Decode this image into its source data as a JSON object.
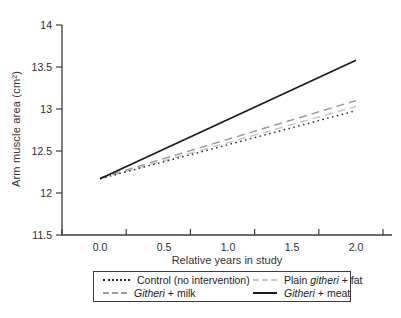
{
  "chart_data": {
    "type": "line",
    "title": "",
    "xlabel": "Relative years in study",
    "ylabel": "Arm muscle area (cm²)",
    "xlim": [
      0,
      2
    ],
    "ylim": [
      11.5,
      14
    ],
    "x_ticks": [
      "0.0",
      "0.5",
      "1.0",
      "1.5",
      "2.0"
    ],
    "y_ticks": [
      "11.5",
      "12",
      "12.5",
      "13",
      "13.5",
      "14"
    ],
    "y_tick_values": [
      11.5,
      12,
      12.5,
      13,
      13.5,
      14
    ],
    "x": [
      0,
      2
    ],
    "series": [
      {
        "name": "Control (no intervention)",
        "values": [
          12.17,
          12.98
        ],
        "style": "dotted",
        "color": "#2b2b2b"
      },
      {
        "name": "Plain githeri + fat",
        "values": [
          12.17,
          13.03
        ],
        "style": "dashed",
        "color": "#c6c6c6"
      },
      {
        "name": "Githeri + milk",
        "values": [
          12.18,
          13.1
        ],
        "style": "dashed",
        "color": "#9a9a9a"
      },
      {
        "name": "Githeri + meat",
        "values": [
          12.17,
          13.58
        ],
        "style": "solid",
        "color": "#1a1a1a"
      }
    ],
    "grid": false,
    "legend_position": "bottom"
  },
  "legend": {
    "entries": [
      {
        "pre": "Control (no intervention)",
        "italic": "",
        "post": ""
      },
      {
        "pre": "Plain ",
        "italic": "githeri",
        "post": " + fat"
      },
      {
        "pre": "",
        "italic": "Githeri",
        "post": " + milk"
      },
      {
        "pre": "",
        "italic": "Githeri",
        "post": " + meat"
      }
    ]
  }
}
